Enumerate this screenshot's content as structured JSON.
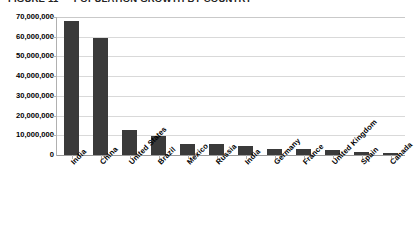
{
  "chart_data": {
    "type": "bar",
    "title": "FIGURE 11 — POPULATION GROWTH BY COUNTRY",
    "xlabel": "",
    "ylabel": "",
    "ylim": [
      0,
      70000000
    ],
    "grid": true,
    "legend": "none",
    "orientation": "vertical",
    "bar_color": "#3a3a3a",
    "categories": [
      "India",
      "China",
      "United States",
      "Brazil",
      "Mexico",
      "Russia",
      "India",
      "Germany",
      "France",
      "United Kingdom",
      "Spain",
      "Canada"
    ],
    "values": [
      68000000,
      59500000,
      12500000,
      9500000,
      5800000,
      5500000,
      4500000,
      3000000,
      2800000,
      2500000,
      1500000,
      1200000
    ],
    "y_ticks": [
      0,
      10000000,
      20000000,
      30000000,
      40000000,
      50000000,
      60000000,
      70000000
    ],
    "y_tick_labels": [
      "0",
      "10,000,000",
      "20,000,000",
      "30,000,000",
      "40,000,000",
      "50,000,000",
      "60,000,000",
      "70,000,000"
    ]
  },
  "axes": {
    "y": {
      "labels": [
        "70,000,000",
        "60,000,000",
        "50,000,000",
        "40,000,000",
        "30,000,000",
        "20,000,000",
        "10,000,000",
        "0"
      ]
    }
  }
}
